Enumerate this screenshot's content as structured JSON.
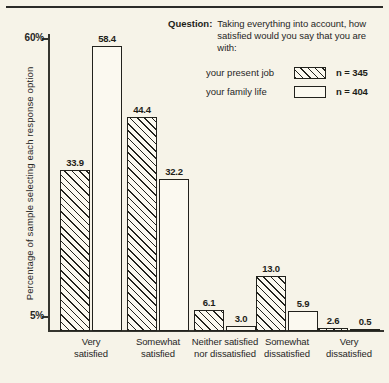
{
  "chart_data": {
    "type": "bar",
    "title": "",
    "subtitle": "",
    "xlabel": "",
    "ylabel": "Percentage of sample selecting each response option",
    "ylim": [
      0,
      60
    ],
    "grid": false,
    "legend_position": "top-right",
    "ytick_labels": [
      "60%",
      "5%"
    ],
    "ytick_values": [
      60,
      5
    ],
    "categories": [
      "Very\nsatisfied",
      "Somewhat\nsatisfied",
      "Neither satisfied\nnor dissatisfied",
      "Somewhat\ndissatisfied",
      "Very\ndissatisfied"
    ],
    "category_lines": [
      [
        "Very",
        "satisfied"
      ],
      [
        "Somewhat",
        "satisfied"
      ],
      [
        "Neither satisfied",
        "nor dissatisfied"
      ],
      [
        "Somewhat",
        "dissatisfied"
      ],
      [
        "Very",
        "dissatisfied"
      ]
    ],
    "series": [
      {
        "name": "your present job",
        "n_label": "n = 345",
        "fill": "hatched",
        "values": [
          33.9,
          44.4,
          6.1,
          13.0,
          2.6
        ]
      },
      {
        "name": "your family life",
        "n_label": "n = 404",
        "fill": "open",
        "values": [
          58.4,
          32.2,
          3.0,
          5.9,
          0.5
        ]
      }
    ],
    "annotations": {
      "question_word": "Question:",
      "question_text": "Taking everything into account, how satisfied would you say that you are with:"
    }
  },
  "legend": {
    "question_word": "Question:",
    "question_text": "Taking everything into account, how satisfied would you say that you are with:",
    "rows": [
      {
        "label": "your present job",
        "n": "n = 345",
        "fill": "hatched"
      },
      {
        "label": "your family life",
        "n": "n = 404",
        "fill": "open"
      }
    ]
  },
  "axis": {
    "y_title": "Percentage of sample selecting each response option",
    "ticks": [
      {
        "label": "60%",
        "value": 60
      },
      {
        "label": "5%",
        "value": 5
      }
    ]
  },
  "colors": {
    "background": "#f6f3e8",
    "ink": "#22221d",
    "bar_fill": "#fbf9f0"
  }
}
